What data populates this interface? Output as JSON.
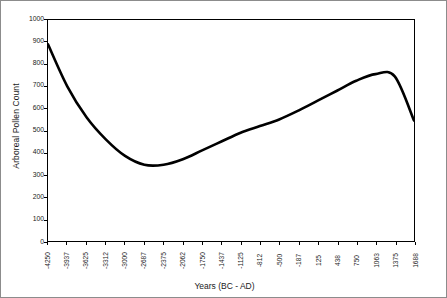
{
  "chart_data": {
    "type": "line",
    "title": "",
    "xlabel": "Years (BC - AD)",
    "ylabel": "Arboreal Pollen Count",
    "xlim": [
      -4250,
      1688
    ],
    "ylim": [
      0,
      1000
    ],
    "grid": false,
    "legend": "none",
    "x_tick_labels": [
      "-4250",
      "-3937",
      "-3625",
      "-3312",
      "-3000",
      "-2687",
      "-2375",
      "-2062",
      "-1750",
      "-1437",
      "-1125",
      "-812",
      "-500",
      "-187",
      "125",
      "438",
      "750",
      "1063",
      "1375",
      "1688"
    ],
    "y_tick_labels": [
      "1000",
      "900",
      "800",
      "700",
      "600",
      "500",
      "400",
      "300",
      "200",
      "100",
      "0"
    ],
    "y_ticks": [
      1000,
      900,
      800,
      700,
      600,
      500,
      400,
      300,
      200,
      100,
      0
    ],
    "categories": [
      -4250,
      -3937,
      -3625,
      -3312,
      -3000,
      -2687,
      -2375,
      -2062,
      -1750,
      -1437,
      -1125,
      -812,
      -500,
      -187,
      125,
      438,
      750,
      1063,
      1375,
      1688
    ],
    "values": [
      890,
      700,
      560,
      460,
      385,
      345,
      345,
      370,
      410,
      450,
      490,
      520,
      550,
      590,
      635,
      680,
      725,
      755,
      745,
      545
    ],
    "series": [
      {
        "name": "Arboreal Pollen Count",
        "color": "#000000",
        "values": [
          890,
          700,
          560,
          460,
          385,
          345,
          345,
          370,
          410,
          450,
          490,
          520,
          550,
          590,
          635,
          680,
          725,
          755,
          745,
          545
        ]
      }
    ],
    "line_color": "#000000",
    "line_width": 2.6
  }
}
